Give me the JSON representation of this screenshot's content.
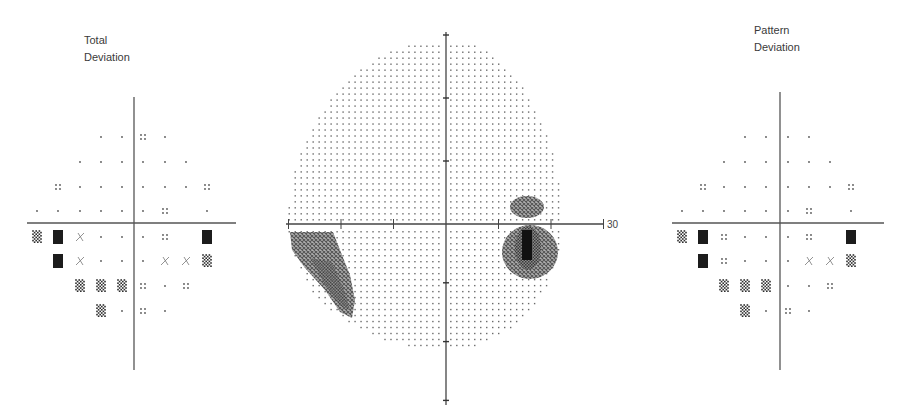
{
  "total_deviation": {
    "title_line1": "Total",
    "title_line2": "Deviation",
    "rows": [
      [
        "",
        "",
        "",
        "dot",
        "dot",
        "p5",
        "dot",
        "",
        ""
      ],
      [
        "",
        "",
        "dot",
        "dot",
        "dot",
        "dot",
        "dot",
        "dot",
        ""
      ],
      [
        "",
        "p5",
        "dot",
        "dot",
        "dot",
        "dot",
        "dot",
        "dot",
        "p5"
      ],
      [
        "dot",
        "dot",
        "dot",
        "dot",
        "dot",
        "dot",
        "p5",
        "",
        "dot"
      ],
      [
        "p1",
        "p05",
        "p2",
        "dot",
        "dot",
        "dot",
        "p5",
        "",
        "p05"
      ],
      [
        "",
        "p05",
        "p2",
        "dot",
        "dot",
        "dot",
        "p2",
        "p2",
        "p1"
      ],
      [
        "",
        "",
        "p1",
        "p1",
        "p1",
        "p5",
        "dot",
        "p5",
        ""
      ],
      [
        "",
        "",
        "",
        "p1",
        "dot",
        "p5",
        "dot",
        "",
        ""
      ]
    ]
  },
  "pattern_deviation": {
    "title_line1": "Pattern",
    "title_line2": "Deviation",
    "rows": [
      [
        "",
        "",
        "",
        "dot",
        "dot",
        "dot",
        "dot",
        "",
        ""
      ],
      [
        "",
        "",
        "dot",
        "dot",
        "dot",
        "dot",
        "dot",
        "dot",
        ""
      ],
      [
        "",
        "p5",
        "dot",
        "dot",
        "dot",
        "dot",
        "dot",
        "dot",
        "p5"
      ],
      [
        "dot",
        "dot",
        "dot",
        "dot",
        "dot",
        "dot",
        "p5",
        "",
        "dot"
      ],
      [
        "p1",
        "p05",
        "p5",
        "dot",
        "dot",
        "dot",
        "p5",
        "",
        "p05"
      ],
      [
        "",
        "p05",
        "p5",
        "dot",
        "dot",
        "dot",
        "p2",
        "p2",
        "p1"
      ],
      [
        "",
        "",
        "p1",
        "p1",
        "p1",
        "dot",
        "dot",
        "p5",
        ""
      ],
      [
        "",
        "",
        "",
        "p1",
        "dot",
        "p5",
        "dot",
        "",
        ""
      ]
    ]
  },
  "greyscale": {
    "axis_label": "30",
    "axis_range_degrees": [
      -30,
      30
    ],
    "tick_step_degrees": 10,
    "defects": [
      {
        "name": "superior-temporal-defect",
        "x_deg": 15,
        "y_deg": 3.5,
        "density": "medium"
      },
      {
        "name": "blind-spot-defect",
        "x_deg": 15,
        "y_deg": -5,
        "density": "dense"
      },
      {
        "name": "inferior-nasal-step-defect",
        "x_deg": -25,
        "y_deg": -8,
        "density": "medium"
      }
    ]
  }
}
